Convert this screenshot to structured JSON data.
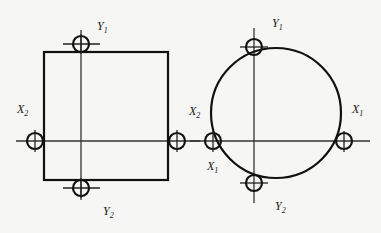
{
  "diagram": {
    "left_figure": {
      "shape": "square",
      "labels": {
        "top": {
          "main": "Y",
          "sub": "1"
        },
        "bottom": {
          "main": "Y",
          "sub": "2"
        },
        "left": {
          "main": "X",
          "sub": "2"
        },
        "right": {
          "main": "X",
          "sub": "2"
        }
      }
    },
    "right_figure": {
      "shape": "circle",
      "labels": {
        "top": {
          "main": "Y",
          "sub": "1"
        },
        "bottom": {
          "main": "Y",
          "sub": "2"
        },
        "left_upper": {
          "main": "X",
          "sub": "2"
        },
        "left_lower": {
          "main": "X",
          "sub": "1"
        },
        "right": {
          "main": "X",
          "sub": "1"
        }
      }
    },
    "colors": {
      "line": "#111111",
      "background": "#f6f6f4"
    }
  }
}
